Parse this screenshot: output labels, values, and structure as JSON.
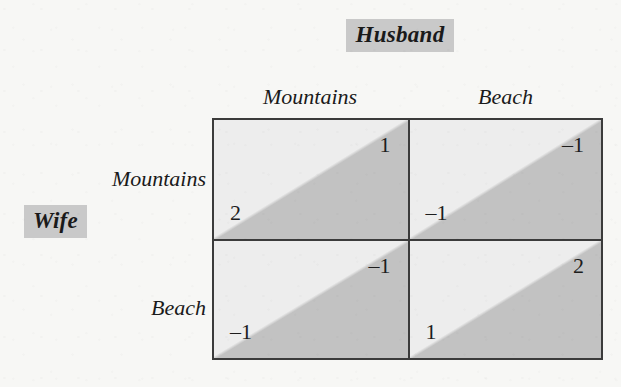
{
  "players": {
    "column": {
      "name": "Husband",
      "highlight_color": "#c9c9c9"
    },
    "row": {
      "name": "Wife",
      "highlight_color": "#c9c9c9"
    }
  },
  "column_strategies": [
    "Mountains",
    "Beach"
  ],
  "row_strategies": [
    "Mountains",
    "Beach"
  ],
  "colors": {
    "page_background": "#f7f7f5",
    "cell_light": "#ededed",
    "cell_dark": "#c2c2c2",
    "border": "#3b3b3b",
    "text": "#1a1a1a"
  },
  "chart_data": {
    "type": "table",
    "title": "Husband",
    "xlabel": "Husband",
    "ylabel": "Wife",
    "categories": [
      "Mountains",
      "Beach"
    ],
    "row_categories": [
      "Mountains",
      "Beach"
    ],
    "cells": [
      {
        "row": "Mountains",
        "column": "Mountains",
        "row_payoff": "2",
        "column_payoff": "1"
      },
      {
        "row": "Mountains",
        "column": "Beach",
        "row_payoff": "–1",
        "column_payoff": "–1"
      },
      {
        "row": "Beach",
        "column": "Mountains",
        "row_payoff": "–1",
        "column_payoff": "–1"
      },
      {
        "row": "Beach",
        "column": "Beach",
        "row_payoff": "1",
        "column_payoff": "2"
      }
    ]
  }
}
